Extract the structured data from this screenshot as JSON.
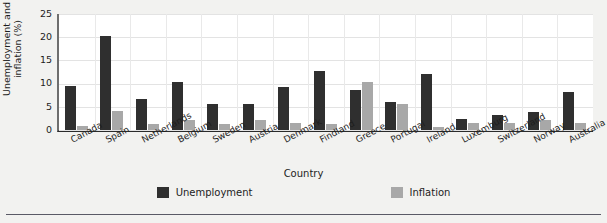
{
  "chart_data": {
    "type": "bar",
    "title": "",
    "xlabel": "Country",
    "ylabel": "Unemployment and inflation (%)",
    "ylim": [
      0,
      25
    ],
    "yticks": [
      0,
      5,
      10,
      15,
      20,
      25
    ],
    "grid": true,
    "legend_position": "bottom",
    "categories": [
      "Canada",
      "Spain",
      "Netherlands",
      "Belgium",
      "Sweden",
      "Austria",
      "Denmark",
      "Findland",
      "Greece",
      "Portugal",
      "Ireland",
      "Luxemburg",
      "Switzerland",
      "Norway",
      "Australia"
    ],
    "series": [
      {
        "name": "Unemployment",
        "color": "#2f2f2f",
        "values": [
          9.5,
          20.3,
          6.6,
          10.4,
          5.6,
          5.7,
          9.3,
          12.7,
          8.7,
          6.0,
          12.1,
          2.3,
          3.2,
          3.9,
          8.1
        ]
      },
      {
        "name": "Inflation",
        "color": "#a8a8a8",
        "values": [
          0.8,
          4.1,
          1.3,
          2.1,
          1.2,
          2.2,
          1.6,
          1.2,
          10.3,
          5.6,
          0.6,
          1.5,
          1.6,
          2.2,
          1.6
        ]
      }
    ]
  },
  "axis": {
    "y_label": "Unemployment and inflation (%)",
    "x_label": "Country",
    "y_tick_labels": [
      "25",
      "20",
      "15",
      "10",
      "5",
      "0"
    ]
  },
  "legend": {
    "items": [
      {
        "label": "Unemployment",
        "color": "#2f2f2f"
      },
      {
        "label": "Inflation",
        "color": "#a8a8a8"
      }
    ]
  },
  "colors": {
    "unemployment": "#2f2f2f",
    "inflation": "#a8a8a8",
    "plot_background": "#ffffff",
    "page_background": "#f2f2f0",
    "axis": "#2b2b2b",
    "gridline": "#e3e3e3"
  }
}
